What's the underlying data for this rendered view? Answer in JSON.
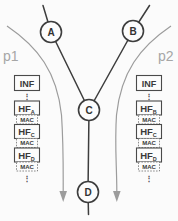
{
  "diagram": {
    "nodes": [
      {
        "id": "A",
        "label": "A"
      },
      {
        "id": "B",
        "label": "B"
      },
      {
        "id": "C",
        "label": "C"
      },
      {
        "id": "D",
        "label": "D"
      }
    ],
    "paths": [
      {
        "id": "p1",
        "label": "p1"
      },
      {
        "id": "p2",
        "label": "p2"
      }
    ],
    "left_stack": {
      "inf": "INF",
      "dots_top": "⋮",
      "items": [
        {
          "hf": "HF",
          "sub": "A",
          "mac": "MAC"
        },
        {
          "hf": "HF",
          "sub": "C",
          "mac": "MAC"
        },
        {
          "hf": "HF",
          "sub": "D",
          "mac": "MAC"
        }
      ],
      "dots_bottom": "⋮"
    },
    "right_stack": {
      "inf": "INF",
      "dots_top": "⋮",
      "items": [
        {
          "hf": "HF",
          "sub": "B",
          "mac": "MAC"
        },
        {
          "hf": "HF",
          "sub": "C",
          "mac": "MAC"
        },
        {
          "hf": "HF",
          "sub": "D",
          "mac": "MAC"
        }
      ],
      "dots_bottom": "⋮"
    },
    "colors": {
      "line_dark": "#3d3d3d",
      "path_gray": "#9c9c9c",
      "label_gray": "#a6a6a6",
      "box_border": "#4a4a4a",
      "mac_border": "#6e6e6e",
      "text": "#3a3a3a",
      "background": "#fbfbfb"
    }
  }
}
